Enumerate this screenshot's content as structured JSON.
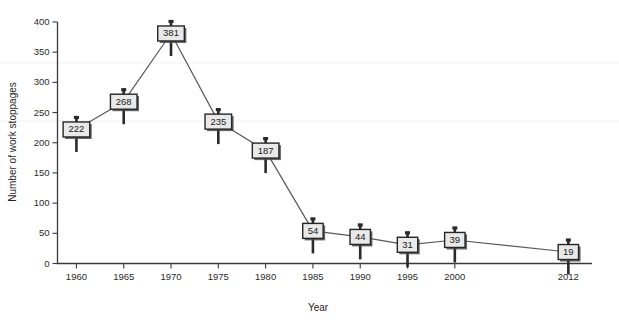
{
  "chart_data": {
    "type": "line",
    "title": "",
    "xlabel": "Year",
    "ylabel": "Number of work stoppages",
    "categories": [
      "1960",
      "1965",
      "1970",
      "1975",
      "1980",
      "1985",
      "1990",
      "1995",
      "2000",
      "2012"
    ],
    "x": [
      1960,
      1965,
      1970,
      1975,
      1980,
      1985,
      1990,
      1995,
      2000,
      2012
    ],
    "values": [
      222,
      268,
      381,
      235,
      187,
      54,
      44,
      31,
      39,
      19
    ],
    "point_labels": [
      "222",
      "268",
      "381",
      "235",
      "187",
      "54",
      "44",
      "31",
      "39",
      "19"
    ],
    "xlim": [
      1958.0,
      2014.5
    ],
    "ylim": [
      0,
      400
    ],
    "yticks": [
      0,
      50,
      100,
      150,
      200,
      250,
      300,
      350,
      400
    ],
    "ytick_labels": [
      "0",
      "50",
      "100",
      "150",
      "200",
      "250",
      "300",
      "350",
      "400"
    ],
    "xtick_labels": [
      "1960",
      "1965",
      "1970",
      "1975",
      "1980",
      "1985",
      "1990",
      "1995",
      "2000",
      "2012"
    ],
    "grid": false,
    "legend": null,
    "marker_style": "labeled-box-pin",
    "colors": {
      "line": "#595959",
      "marker_fill": "#e9e9e9",
      "marker_border": "#262626",
      "axis": "#3a3a3a",
      "text": "#1f1f1f",
      "background": "#ffffff"
    }
  }
}
